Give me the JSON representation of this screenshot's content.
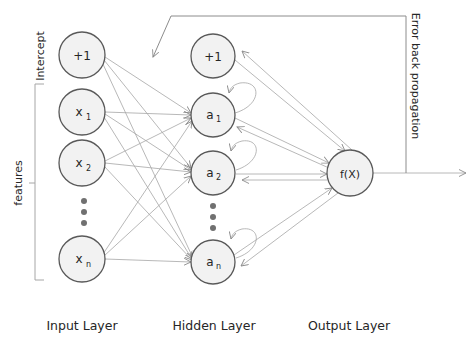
{
  "diagram": {
    "type": "neural-network",
    "input_layer": {
      "label": "Input Layer",
      "nodes": [
        {
          "id": "bias",
          "text": "+1",
          "sub": ""
        },
        {
          "id": "x1",
          "text": "x",
          "sub": "1"
        },
        {
          "id": "x2",
          "text": "x",
          "sub": "2"
        },
        {
          "id": "xn",
          "text": "x",
          "sub": "n"
        }
      ]
    },
    "hidden_layer": {
      "label": "Hidden Layer",
      "nodes": [
        {
          "id": "bias",
          "text": "+1",
          "sub": ""
        },
        {
          "id": "a1",
          "text": "a",
          "sub": "1"
        },
        {
          "id": "a2",
          "text": "a",
          "sub": "2"
        },
        {
          "id": "an",
          "text": "a",
          "sub": "n"
        }
      ]
    },
    "output_layer": {
      "label": "Output Layer",
      "nodes": [
        {
          "id": "f",
          "text": "f(X)"
        }
      ]
    },
    "side_labels": {
      "intercept": "Intercept",
      "features": "features",
      "backprop": "Error back propagation"
    },
    "colors": {
      "node_fill": "#f2f2f2",
      "node_stroke": "#595959",
      "edge": "#a6a6a6",
      "text": "#262626"
    }
  }
}
